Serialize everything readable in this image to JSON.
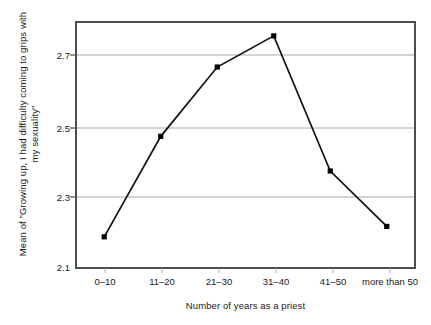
{
  "chart_data": {
    "type": "line",
    "title": "",
    "xlabel": "Number of years as a priest",
    "ylabel": "Mean of \"Growing up, I had difficulty coming to grips with my sexuality\"",
    "categories": [
      "0–10",
      "11–20",
      "21–30",
      "31–40",
      "41–50",
      "more than 50"
    ],
    "values": [
      2.19,
      2.48,
      2.68,
      2.77,
      2.38,
      2.22
    ],
    "ylim": [
      2.1,
      2.81
    ],
    "yticks": [
      "2.1",
      "2.3",
      "2.5",
      "2.7"
    ],
    "ytick_values": [
      2.1,
      2.3,
      2.5,
      2.7
    ],
    "grid": "horizontal",
    "legend": "none",
    "series": [
      {
        "name": "Mean difficulty coming to grips with sexuality",
        "marker": "filled-square",
        "color": "#000000",
        "values": [
          2.19,
          2.48,
          2.68,
          2.77,
          2.38,
          2.22
        ]
      }
    ]
  },
  "axis": {
    "y_title": "Mean of \"Growing up, I had difficulty coming to grips with my sexuality\"",
    "x_title": "Number of years as a priest",
    "y_ticks": [
      "2.7",
      "2.5",
      "2.3",
      "2.1"
    ],
    "x_ticks": [
      "0–10",
      "11–20",
      "21–30",
      "31–40",
      "41–50",
      "more than 50"
    ]
  },
  "colors": {
    "frame": "#4d4d4d",
    "gridline": "#aaaaaa",
    "series_line": "#111111",
    "marker": "#000000",
    "background": "#ffffff",
    "text": "#1a1a1a"
  }
}
